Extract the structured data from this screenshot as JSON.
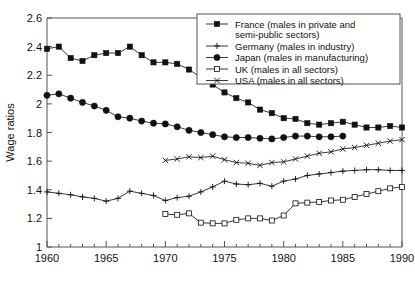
{
  "chart_data": {
    "type": "line",
    "title": "",
    "xlabel": "",
    "ylabel": "Wage ratios",
    "xlim": [
      1960,
      1990
    ],
    "ylim": [
      1,
      2.6
    ],
    "ytick_labels": [
      "1",
      "1.2",
      "1.4",
      "1.6",
      "1.8",
      "2",
      "2.2",
      "2.4",
      "2.6"
    ],
    "ytick_values": [
      1,
      1.2,
      1.4,
      1.6,
      1.8,
      2,
      2.2,
      2.4,
      2.6
    ],
    "xtick_labels": [
      "1960",
      "1965",
      "1970",
      "1975",
      "1980",
      "1985",
      "1990"
    ],
    "xtick_values": [
      1960,
      1965,
      1970,
      1975,
      1980,
      1985,
      1990
    ],
    "minor_xticks": true,
    "grid": false,
    "legend_position": "top-right",
    "series": [
      {
        "name": "France (males in private and semi-public sectors)",
        "short_name": "France",
        "marker": "filled-square",
        "x": [
          1960,
          1961,
          1962,
          1963,
          1964,
          1965,
          1966,
          1967,
          1968,
          1969,
          1970,
          1971,
          1972,
          1973,
          1974,
          1975,
          1976,
          1977,
          1978,
          1979,
          1980,
          1981,
          1982,
          1983,
          1984,
          1985,
          1986,
          1987,
          1988,
          1989,
          1990
        ],
        "values": [
          2.385,
          2.4,
          2.32,
          2.3,
          2.34,
          2.355,
          2.355,
          2.4,
          2.34,
          2.29,
          2.29,
          2.28,
          2.24,
          2.185,
          2.135,
          2.08,
          2.04,
          2.01,
          1.96,
          1.935,
          1.9,
          1.895,
          1.865,
          1.855,
          1.865,
          1.875,
          1.855,
          1.835,
          1.835,
          1.845,
          1.835
        ]
      },
      {
        "name": "Germany (males in industry)",
        "short_name": "Germany",
        "marker": "plus",
        "x": [
          1960,
          1961,
          1962,
          1963,
          1964,
          1965,
          1966,
          1967,
          1968,
          1969,
          1970,
          1971,
          1972,
          1973,
          1974,
          1975,
          1976,
          1977,
          1978,
          1979,
          1980,
          1981,
          1982,
          1983,
          1984,
          1985,
          1986,
          1987,
          1988,
          1989,
          1990
        ],
        "values": [
          1.385,
          1.375,
          1.365,
          1.35,
          1.34,
          1.32,
          1.34,
          1.39,
          1.375,
          1.36,
          1.325,
          1.345,
          1.355,
          1.385,
          1.42,
          1.46,
          1.44,
          1.435,
          1.445,
          1.425,
          1.46,
          1.475,
          1.5,
          1.51,
          1.52,
          1.53,
          1.535,
          1.54,
          1.54,
          1.535,
          1.535
        ]
      },
      {
        "name": "Japan (males in manufacturing)",
        "short_name": "Japan",
        "marker": "filled-circle",
        "x": [
          1960,
          1961,
          1962,
          1963,
          1964,
          1965,
          1966,
          1967,
          1968,
          1969,
          1970,
          1971,
          1972,
          1973,
          1974,
          1975,
          1976,
          1977,
          1978,
          1979,
          1980,
          1981,
          1982,
          1983,
          1984,
          1985
        ],
        "values": [
          2.06,
          2.07,
          2.04,
          2.01,
          1.985,
          1.955,
          1.91,
          1.9,
          1.88,
          1.865,
          1.86,
          1.84,
          1.815,
          1.8,
          1.785,
          1.77,
          1.765,
          1.765,
          1.76,
          1.755,
          1.765,
          1.775,
          1.775,
          1.77,
          1.77,
          1.775
        ]
      },
      {
        "name": "UK (males in all sectors)",
        "short_name": "UK",
        "marker": "open-square",
        "x": [
          1970,
          1971,
          1972,
          1973,
          1974,
          1975,
          1976,
          1977,
          1978,
          1979,
          1980,
          1981,
          1982,
          1983,
          1984,
          1985,
          1986,
          1987,
          1988,
          1989,
          1990
        ],
        "values": [
          1.23,
          1.225,
          1.235,
          1.17,
          1.165,
          1.165,
          1.19,
          1.2,
          1.2,
          1.185,
          1.22,
          1.305,
          1.31,
          1.315,
          1.325,
          1.33,
          1.35,
          1.37,
          1.39,
          1.41,
          1.42
        ]
      },
      {
        "name": "USA (males in all sectors)",
        "short_name": "USA",
        "marker": "x",
        "x": [
          1970,
          1971,
          1972,
          1973,
          1974,
          1975,
          1976,
          1977,
          1978,
          1979,
          1980,
          1981,
          1982,
          1983,
          1984,
          1985,
          1986,
          1987,
          1988,
          1989,
          1990
        ],
        "values": [
          1.605,
          1.615,
          1.63,
          1.625,
          1.635,
          1.61,
          1.59,
          1.585,
          1.57,
          1.59,
          1.595,
          1.615,
          1.635,
          1.655,
          1.665,
          1.685,
          1.695,
          1.71,
          1.725,
          1.74,
          1.75
        ]
      }
    ],
    "legend_entries": [
      {
        "marker": "filled-square",
        "label_line1": "France (males in private and",
        "label_line2": "semi-public sectors)"
      },
      {
        "marker": "plus",
        "label_line1": "Germany (males in industry)",
        "label_line2": ""
      },
      {
        "marker": "filled-circle",
        "label_line1": "Japan (males in manufacturing)",
        "label_line2": ""
      },
      {
        "marker": "open-square",
        "label_line1": "UK (males in all sectors)",
        "label_line2": ""
      },
      {
        "marker": "x",
        "label_line1": "USA (males in all sectors)",
        "label_line2": ""
      }
    ],
    "colors": {
      "ink": "#111111",
      "axis": "#555555",
      "background": "#ffffff"
    }
  }
}
